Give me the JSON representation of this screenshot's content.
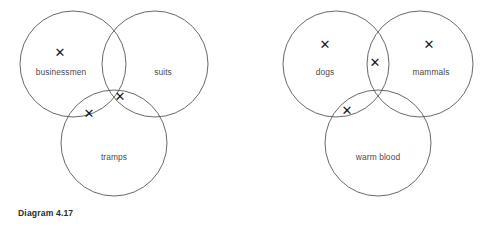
{
  "page": {
    "background_color": "#ffffff",
    "circle_stroke_color": "#58585a",
    "label_color": "#4a4a4c",
    "mark_color": "#1b1b1b",
    "caption_color": "#2b2b2d",
    "mark_glyph": "✕"
  },
  "figures": [
    {
      "id": "diagram-4-17",
      "caption": "Diagram 4.17",
      "circles": [
        {
          "name": "businessmen",
          "cx": 73,
          "cy": 64,
          "r": 53
        },
        {
          "name": "suits",
          "cx": 155,
          "cy": 64,
          "r": 53
        },
        {
          "name": "tramps",
          "cx": 114,
          "cy": 143,
          "r": 53
        }
      ],
      "labels": [
        {
          "text": "businessmen",
          "x": 61,
          "y": 72
        },
        {
          "text": "suits",
          "x": 163,
          "y": 72
        },
        {
          "text": "tramps",
          "x": 114,
          "y": 157
        }
      ],
      "marks": [
        {
          "region": "businessmen-only",
          "x": 60,
          "y": 52
        },
        {
          "region": "businessmen-and-tramps",
          "x": 89,
          "y": 113
        },
        {
          "region": "businessmen-suits-tramps",
          "x": 120,
          "y": 96
        }
      ]
    },
    {
      "id": "diagram-4-18",
      "caption": "Diagram 4.18",
      "circles": [
        {
          "name": "dogs",
          "cx": 86,
          "cy": 64,
          "r": 53
        },
        {
          "name": "mammals",
          "cx": 170,
          "cy": 64,
          "r": 53
        },
        {
          "name": "warm blood",
          "cx": 128,
          "cy": 143,
          "r": 53
        }
      ],
      "labels": [
        {
          "text": "dogs",
          "x": 75,
          "y": 72
        },
        {
          "text": "mammals",
          "x": 181,
          "y": 72
        },
        {
          "text": "warm blood",
          "x": 128,
          "y": 157
        }
      ],
      "marks": [
        {
          "region": "dogs-only",
          "x": 75,
          "y": 44
        },
        {
          "region": "dogs-and-mammals",
          "x": 125,
          "y": 62
        },
        {
          "region": "dogs-and-warm-blood",
          "x": 97,
          "y": 110
        },
        {
          "region": "mammals-only",
          "x": 179,
          "y": 44
        }
      ]
    }
  ]
}
